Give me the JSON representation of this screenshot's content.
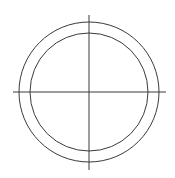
{
  "drawing": {
    "stroke_color": "#3a3a3a",
    "background": "#ffffff",
    "center": {
      "x": 89,
      "y": 92
    },
    "outer_circle_radius": 70,
    "inner_circle_radius": 59,
    "horizontal_centerline": {
      "x1": 13,
      "x2": 166,
      "y": 92
    },
    "vertical_centerline": {
      "x": 89,
      "y1": 15,
      "y2": 170
    }
  }
}
